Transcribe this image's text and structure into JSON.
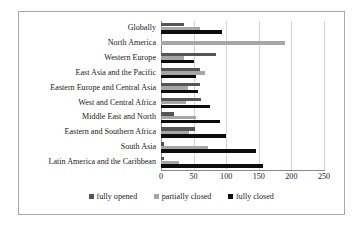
{
  "chart_data": {
    "type": "bar",
    "orientation": "horizontal",
    "title": "",
    "subtitle": "",
    "xlabel": "",
    "ylabel": "",
    "xlim": [
      0,
      250
    ],
    "xticks": [
      0,
      50,
      100,
      150,
      200,
      250
    ],
    "xtick_labels": [
      "0",
      "50",
      "100",
      "150",
      "200",
      "250"
    ],
    "grid": true,
    "legend_position": "bottom",
    "categories": [
      "Globally",
      "North America",
      "Western Europe",
      "East Asia and the Pacific",
      "Eastern Europe and Central Asia",
      "West and Central Africa",
      "Middle East and North",
      "Eastern and Southern Africa",
      "South Asia",
      "Latin America and the Caribbean"
    ],
    "series": [
      {
        "name": "fully opened",
        "color": "#555555",
        "values": [
          35,
          0,
          85,
          60,
          60,
          62,
          20,
          52,
          5,
          4
        ]
      },
      {
        "name": "partially closed",
        "color": "#a6a6a6",
        "values": [
          60,
          190,
          35,
          68,
          42,
          38,
          53,
          43,
          72,
          27
        ]
      },
      {
        "name": "fully closed",
        "color": "#0d0d0d",
        "values": [
          94,
          0,
          50,
          53,
          57,
          75,
          90,
          100,
          145,
          157
        ]
      }
    ]
  }
}
